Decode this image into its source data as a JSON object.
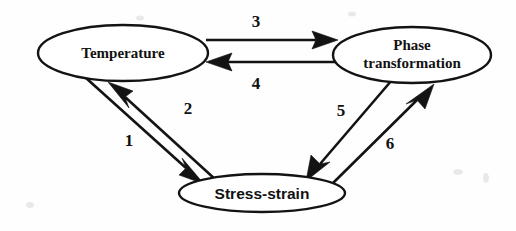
{
  "figure": {
    "type": "directed-graph",
    "title": "",
    "background_color": "#fefefe",
    "line_color": "#131313",
    "text_color": "#121212"
  },
  "nodes": [
    {
      "id": "temperature",
      "label": "Temperature",
      "label_lines": [
        "Temperature"
      ],
      "shape": "ellipse",
      "font": "serif-bold",
      "cx": 123,
      "cy": 53,
      "rx": 85,
      "ry": 28
    },
    {
      "id": "phase-transformation",
      "label": "Phase transformation",
      "label_lines": [
        "Phase",
        "transformation"
      ],
      "shape": "ellipse",
      "font": "serif-bold",
      "cx": 412,
      "cy": 55,
      "rx": 79,
      "ry": 28
    },
    {
      "id": "stress-strain",
      "label": "Stress-strain",
      "label_lines": [
        "Stress-strain"
      ],
      "shape": "ellipse",
      "font": "sans-bold",
      "cx": 262,
      "cy": 193,
      "rx": 83,
      "ry": 19
    }
  ],
  "edges": [
    {
      "number": "1",
      "from": "temperature",
      "to": "stress-strain",
      "label_x": 129,
      "label_y": 146,
      "direction": "down-right"
    },
    {
      "number": "2",
      "from": "stress-strain",
      "to": "temperature",
      "label_x": 188,
      "label_y": 114,
      "direction": "up-left"
    },
    {
      "number": "3",
      "from": "temperature",
      "to": "phase-transformation",
      "label_x": 256,
      "label_y": 27,
      "direction": "right"
    },
    {
      "number": "4",
      "from": "phase-transformation",
      "to": "temperature",
      "label_x": 256,
      "label_y": 89,
      "direction": "left"
    },
    {
      "number": "5",
      "from": "phase-transformation",
      "to": "stress-strain",
      "label_x": 341,
      "label_y": 116,
      "direction": "down-left"
    },
    {
      "number": "6",
      "from": "stress-strain",
      "to": "phase-transformation",
      "label_x": 390,
      "label_y": 149,
      "direction": "up-right"
    }
  ]
}
